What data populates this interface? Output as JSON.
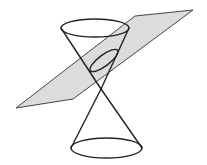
{
  "diagram": {
    "colors": {
      "background": "#ffffff",
      "plane_fill": "#dcdcdc",
      "plane_stroke": "#444444",
      "line": "#222222"
    },
    "plane": {
      "points": "16,108 73,99 193,10 135,16"
    },
    "apex": {
      "x": 101,
      "y": 89
    },
    "top_ellipse": {
      "cx": 95,
      "cy": 28,
      "rx": 34,
      "ry": 9
    },
    "bottom_ellipse": {
      "cx": 106.5,
      "cy": 148,
      "rx": 35.5,
      "ry": 10
    },
    "section_ellipse": {
      "cx": 104,
      "cy": 60.5,
      "rx": 17,
      "ry": 5.5,
      "rotation": -37
    },
    "generators": [
      {
        "x1": 61,
        "y1": 28,
        "x2": 101,
        "y2": 89
      },
      {
        "x1": 129,
        "y1": 28,
        "x2": 101,
        "y2": 89
      },
      {
        "x1": 101,
        "y1": 89,
        "x2": 71,
        "y2": 148
      },
      {
        "x1": 101,
        "y1": 89,
        "x2": 142,
        "y2": 148
      }
    ]
  }
}
